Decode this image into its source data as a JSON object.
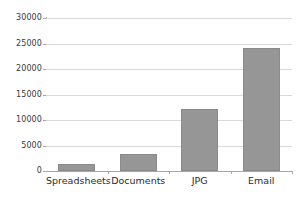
{
  "chart_data": {
    "type": "bar",
    "title": "",
    "subtitle": "",
    "xlabel": "",
    "ylabel": "",
    "categories": [
      "Spreadsheets",
      "Documents",
      "JPG",
      "Email"
    ],
    "values": [
      1400,
      3400,
      12200,
      24200
    ],
    "ylim": [
      0,
      30000
    ],
    "yticks": [
      0,
      5000,
      10000,
      15000,
      20000,
      25000,
      30000
    ],
    "ytick_labels": [
      "0",
      "5000",
      "10000",
      "15000",
      "20000",
      "25000",
      "30000"
    ],
    "grid": true,
    "legend": false,
    "legend_position": "none",
    "colors": {
      "bar_fill": "#969696",
      "bar_edge": "#8a8a8a",
      "gridline": "#d9d9d9",
      "axis": "#a6a6a6",
      "plot_background": "#ffffff",
      "tick_text": "#2b2b2b"
    }
  }
}
